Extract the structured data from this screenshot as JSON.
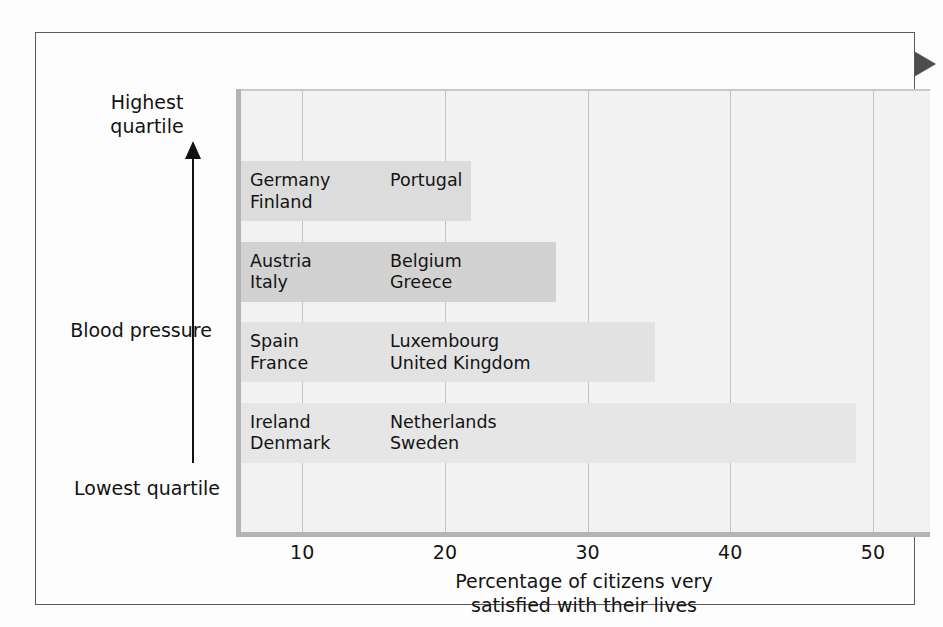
{
  "figure": {
    "marker_icon": "right-triangle-marker"
  },
  "chart_data": {
    "type": "bar",
    "orientation": "horizontal",
    "title": "",
    "xlabel_line1": "Percentage of citizens very",
    "xlabel_line2": "satisfied with their lives",
    "ylabel": "Blood pressure",
    "y_axis_top_label_line1": "Highest",
    "y_axis_top_label_line2": "quartile",
    "y_axis_bottom_label_line1": "Lowest",
    "y_axis_bottom_label_line2": "quartile",
    "y_axis_direction_icon": "up-arrow-icon",
    "xlim": [
      5.5,
      54.0
    ],
    "xticks": [
      10,
      20,
      30,
      40,
      50
    ],
    "xtick_labels": [
      "10",
      "20",
      "30",
      "40",
      "50"
    ],
    "grid": "vertical",
    "legend": "none",
    "categories": [
      "Highest quartile",
      "Second quartile",
      "Third quartile",
      "Lowest quartile"
    ],
    "values": [
      21.8,
      27.8,
      34.7,
      48.8
    ],
    "bar_colors": [
      "#dcdcdc",
      "#d2d2d2",
      "#e2e2e2",
      "#e6e6e6"
    ],
    "bars": [
      {
        "quartile": "Highest quartile",
        "value": 21.8,
        "color": "#dcdcdc",
        "countries_col1": [
          "Germany",
          "Finland"
        ],
        "countries_col2": [
          "Portugal"
        ]
      },
      {
        "quartile": "Second quartile",
        "value": 27.8,
        "color": "#d2d2d2",
        "countries_col1": [
          "Austria",
          "Italy"
        ],
        "countries_col2": [
          "Belgium",
          "Greece"
        ]
      },
      {
        "quartile": "Third quartile",
        "value": 34.7,
        "color": "#e2e2e2",
        "countries_col1": [
          "Spain",
          "France"
        ],
        "countries_col2": [
          "Luxembourg",
          "United Kingdom"
        ]
      },
      {
        "quartile": "Lowest quartile",
        "value": 48.8,
        "color": "#e6e6e6",
        "countries_col1": [
          "Ireland",
          "Denmark"
        ],
        "countries_col2": [
          "Netherlands",
          "Sweden"
        ]
      }
    ],
    "plot_background": "#f2f2f2",
    "axis_rule_color": "#b4b4b4",
    "gridline_color": "#c4c4c4",
    "frame_color": "#5a5a5a",
    "marker_color": "#4d4d4d"
  }
}
